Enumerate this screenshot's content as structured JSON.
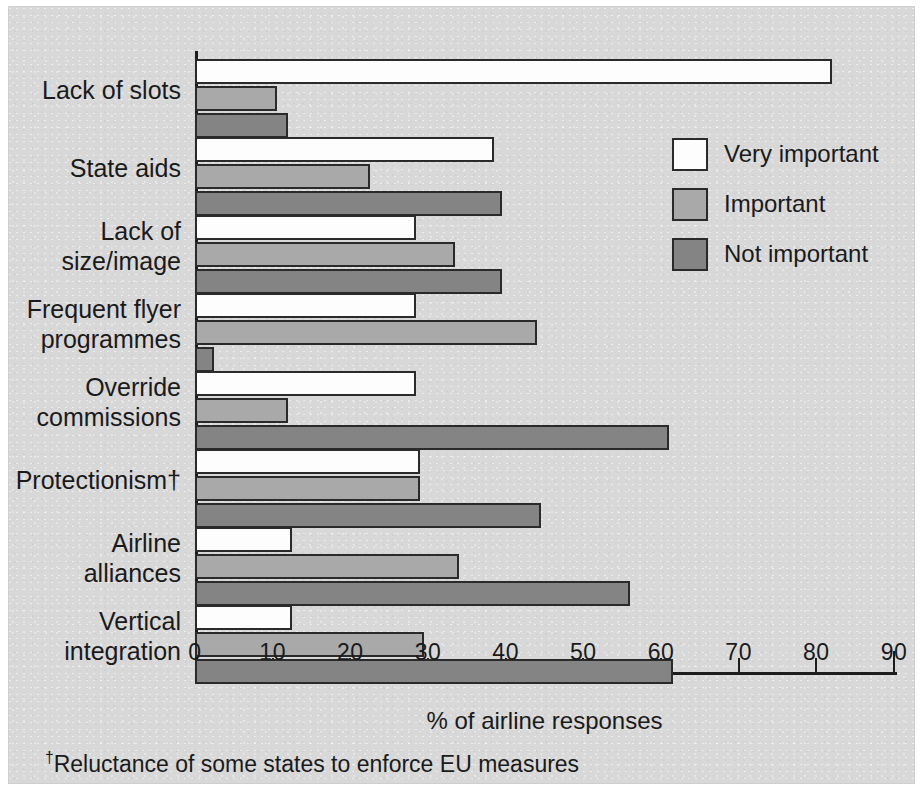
{
  "chart_data": {
    "type": "bar",
    "orientation": "horizontal",
    "title": "",
    "xlabel": "% of airline responses",
    "ylabel": "",
    "xlim": [
      0,
      90
    ],
    "xticks": [
      0,
      10,
      20,
      30,
      40,
      50,
      60,
      70,
      80,
      90
    ],
    "grid": false,
    "legend_position": "top-right",
    "categories": [
      "Lack of slots",
      "State aids",
      "Lack of\nsize/image",
      "Frequent flyer\nprogrammes",
      "Override\ncommissions",
      "Protectionism†",
      "Airline\nalliances",
      "Vertical\nintegration"
    ],
    "series": [
      {
        "name": "Very important",
        "color": "#fdfdfd",
        "values": [
          82,
          38.5,
          28.5,
          28.5,
          28.5,
          29,
          12.5,
          12.5
        ]
      },
      {
        "name": "Important",
        "color": "#a9a9a9",
        "values": [
          10.5,
          22.5,
          33.5,
          44,
          12,
          29,
          34,
          29.5
        ]
      },
      {
        "name": "Not important",
        "color": "#848484",
        "values": [
          12,
          39.5,
          39.5,
          2.5,
          61,
          44.5,
          56,
          61.5
        ]
      }
    ],
    "footnote": "†Reluctance of some states to enforce EU measures",
    "footnote_marker": "†",
    "footnote_text": "Reluctance of some states to enforce EU measures"
  },
  "legend": {
    "items": [
      {
        "label": "Very important",
        "swatch": "very"
      },
      {
        "label": "Important",
        "swatch": "imp"
      },
      {
        "label": "Not important",
        "swatch": "not"
      }
    ]
  },
  "axis": {
    "x_title": "% of airline responses",
    "tick_labels": [
      "0",
      "10",
      "20",
      "30",
      "40",
      "50",
      "60",
      "70",
      "80",
      "90"
    ]
  },
  "colors": {
    "background": "#d8d8d8",
    "ink": "#1a1a1a",
    "very_important": "#fdfdfd",
    "important": "#a9a9a9",
    "not_important": "#848484"
  }
}
